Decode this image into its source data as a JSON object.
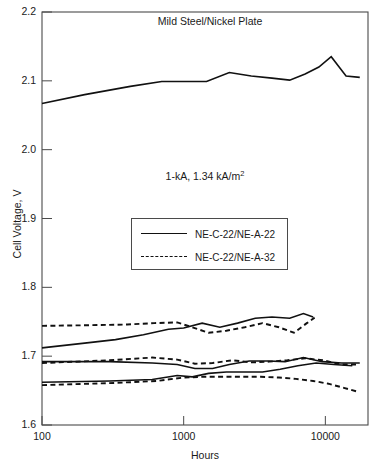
{
  "chart_data": {
    "type": "line",
    "title": "Mild Steel/Nickel Plate",
    "xlabel": "Hours",
    "ylabel": "Cell Voltage, V",
    "xscale": "log",
    "xlim": [
      100,
      20000
    ],
    "ylim": [
      1.6,
      2.2
    ],
    "xticks": [
      100,
      1000,
      10000
    ],
    "xtick_labels": [
      "100",
      "1000",
      "10000"
    ],
    "yticks": [
      1.6,
      1.7,
      1.8,
      1.9,
      2.0,
      2.1,
      2.2
    ],
    "ytick_labels": [
      "1.6",
      "1.7",
      "1.8",
      "1.9",
      "2.0",
      "2.1",
      "2.2"
    ],
    "grid": false,
    "annotation": "1-kA, 1.34 kA/m",
    "annotation_superscript": "2",
    "legend_position": "center",
    "legend": [
      {
        "label": "NE-C-22/NE-A-22",
        "style": "solid"
      },
      {
        "label": "NE-C-22/NE-A-32",
        "style": "dashed"
      }
    ],
    "series": [
      {
        "name": "top-cell-voltage",
        "style": "solid",
        "x": [
          100,
          200,
          420,
          700,
          1000,
          1450,
          2100,
          3000,
          4200,
          5600,
          7200,
          9000,
          11000,
          14000,
          17500
        ],
        "y": [
          2.067,
          2.08,
          2.092,
          2.099,
          2.099,
          2.099,
          2.112,
          2.107,
          2.104,
          2.101,
          2.11,
          2.12,
          2.135,
          2.107,
          2.105
        ]
      },
      {
        "name": "band-a-solid",
        "style": "solid",
        "x": [
          100,
          200,
          330,
          520,
          780,
          1000,
          1350,
          1800,
          2400,
          3200,
          4200,
          5600,
          7000,
          8200
        ],
        "y": [
          1.712,
          1.719,
          1.724,
          1.731,
          1.739,
          1.741,
          1.748,
          1.742,
          1.748,
          1.755,
          1.757,
          1.755,
          1.762,
          1.757
        ]
      },
      {
        "name": "band-a-dashed",
        "style": "dashed",
        "x": [
          100,
          220,
          400,
          620,
          900,
          1150,
          1500,
          2000,
          2700,
          3600,
          4700,
          6000,
          7400,
          8400
        ],
        "y": [
          1.744,
          1.745,
          1.746,
          1.748,
          1.749,
          1.742,
          1.734,
          1.737,
          1.742,
          1.748,
          1.742,
          1.734,
          1.748,
          1.756
        ]
      },
      {
        "name": "band-b-solid",
        "style": "solid",
        "x": [
          100,
          300,
          600,
          900,
          1200,
          1600,
          2100,
          2900,
          3900,
          5200,
          7000,
          9500,
          13000,
          17500
        ],
        "y": [
          1.692,
          1.692,
          1.69,
          1.688,
          1.682,
          1.682,
          1.688,
          1.693,
          1.693,
          1.692,
          1.698,
          1.692,
          1.69,
          1.69
        ]
      },
      {
        "name": "band-b-dashed",
        "style": "dashed",
        "x": [
          100,
          300,
          600,
          900,
          1200,
          1600,
          2200,
          3000,
          4000,
          5400,
          7200,
          9600,
          13000,
          17000
        ],
        "y": [
          1.69,
          1.694,
          1.698,
          1.695,
          1.689,
          1.69,
          1.694,
          1.691,
          1.692,
          1.694,
          1.697,
          1.694,
          1.688,
          1.688
        ]
      },
      {
        "name": "band-c-solid",
        "style": "solid",
        "x": [
          100,
          300,
          600,
          900,
          1150,
          1500,
          2000,
          2700,
          3600,
          4800,
          6400,
          8600,
          11500,
          15500
        ],
        "y": [
          1.662,
          1.664,
          1.666,
          1.672,
          1.67,
          1.675,
          1.677,
          1.677,
          1.677,
          1.681,
          1.686,
          1.69,
          1.688,
          1.686
        ]
      },
      {
        "name": "band-c-dashed",
        "style": "dashed",
        "x": [
          100,
          320,
          650,
          1000,
          1400,
          1900,
          2600,
          3500,
          4700,
          6200,
          8200,
          10500,
          13500,
          16500
        ],
        "y": [
          1.658,
          1.661,
          1.664,
          1.669,
          1.67,
          1.67,
          1.67,
          1.67,
          1.669,
          1.667,
          1.664,
          1.66,
          1.654,
          1.649
        ]
      }
    ]
  },
  "colors": {
    "line": "#111111",
    "axis": "#4a4a4a",
    "text": "#1a1a1a",
    "background": "#ffffff"
  }
}
